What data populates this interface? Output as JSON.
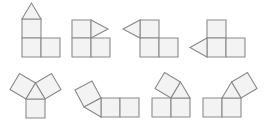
{
  "style": {
    "background": "#ffffff",
    "stroke": "#8a8a8a",
    "fill": "#f3f3f3",
    "stroke_width": 1.1
  },
  "figures": [
    {
      "id": "net-1",
      "squares": [
        [
          [
            22,
            19
          ],
          [
            41,
            19
          ],
          [
            41,
            38
          ],
          [
            22,
            38
          ]
        ],
        [
          [
            22,
            38
          ],
          [
            41,
            38
          ],
          [
            41,
            57
          ],
          [
            22,
            57
          ]
        ],
        [
          [
            41,
            38
          ],
          [
            60,
            38
          ],
          [
            60,
            57
          ],
          [
            41,
            57
          ]
        ]
      ],
      "triangles": [
        [
          [
            22,
            19
          ],
          [
            41,
            19
          ],
          [
            31.5,
            3
          ]
        ]
      ]
    },
    {
      "id": "net-2",
      "squares": [
        [
          [
            72,
            20
          ],
          [
            91,
            20
          ],
          [
            91,
            38
          ],
          [
            72,
            38
          ]
        ],
        [
          [
            72,
            38
          ],
          [
            91,
            38
          ],
          [
            91,
            57
          ],
          [
            72,
            57
          ]
        ],
        [
          [
            91,
            38
          ],
          [
            110,
            38
          ],
          [
            110,
            57
          ],
          [
            91,
            57
          ]
        ]
      ],
      "triangles": [
        [
          [
            91,
            20
          ],
          [
            108,
            29
          ],
          [
            91,
            38
          ]
        ]
      ]
    },
    {
      "id": "net-3",
      "squares": [
        [
          [
            140,
            20
          ],
          [
            159,
            20
          ],
          [
            159,
            38
          ],
          [
            140,
            38
          ]
        ],
        [
          [
            140,
            38
          ],
          [
            159,
            38
          ],
          [
            159,
            57
          ],
          [
            140,
            57
          ]
        ],
        [
          [
            159,
            38
          ],
          [
            178,
            38
          ],
          [
            178,
            57
          ],
          [
            159,
            57
          ]
        ]
      ],
      "triangles": [
        [
          [
            140,
            20
          ],
          [
            140,
            38
          ],
          [
            123,
            29
          ]
        ]
      ]
    },
    {
      "id": "net-4",
      "squares": [
        [
          [
            207,
            20
          ],
          [
            226,
            20
          ],
          [
            226,
            38
          ],
          [
            207,
            38
          ]
        ],
        [
          [
            207,
            38
          ],
          [
            226,
            38
          ],
          [
            226,
            57
          ],
          [
            207,
            57
          ]
        ],
        [
          [
            226,
            38
          ],
          [
            245,
            38
          ],
          [
            245,
            57
          ],
          [
            226,
            57
          ]
        ]
      ],
      "triangles": [
        [
          [
            207,
            38
          ],
          [
            207,
            57
          ],
          [
            190,
            47.5
          ]
        ]
      ]
    },
    {
      "id": "net-5",
      "squares": [
        [
          [
            26,
            99
          ],
          [
            45,
            99
          ],
          [
            45,
            118
          ],
          [
            26,
            118
          ]
        ],
        [
          [
            26,
            99
          ],
          [
            35.5,
            83
          ],
          [
            19.5,
            73.5
          ],
          [
            10,
            89.5
          ]
        ],
        [
          [
            35.5,
            83
          ],
          [
            45,
            99
          ],
          [
            61,
            89.5
          ],
          [
            51.5,
            73.5
          ]
        ]
      ],
      "triangles": [
        [
          [
            26,
            99
          ],
          [
            45,
            99
          ],
          [
            35.5,
            83
          ]
        ]
      ]
    },
    {
      "id": "net-6",
      "squares": [
        [
          [
            101,
            98
          ],
          [
            120,
            98
          ],
          [
            120,
            117
          ],
          [
            101,
            117
          ]
        ],
        [
          [
            120,
            98
          ],
          [
            139,
            98
          ],
          [
            139,
            117
          ],
          [
            120,
            117
          ]
        ],
        [
          [
            84,
            107
          ],
          [
            101,
            98
          ],
          [
            92,
            81
          ],
          [
            75,
            90
          ]
        ]
      ],
      "triangles": [
        [
          [
            101,
            98
          ],
          [
            101,
            117
          ],
          [
            84,
            107
          ]
        ]
      ]
    },
    {
      "id": "net-7",
      "squares": [
        [
          [
            152,
            98
          ],
          [
            171,
            98
          ],
          [
            171,
            117
          ],
          [
            152,
            117
          ]
        ],
        [
          [
            171,
            98
          ],
          [
            190,
            98
          ],
          [
            190,
            117
          ],
          [
            171,
            117
          ]
        ],
        [
          [
            171,
            98
          ],
          [
            180.5,
            82
          ],
          [
            164.5,
            72.5
          ],
          [
            155,
            88.5
          ]
        ]
      ],
      "triangles": [
        [
          [
            171,
            98
          ],
          [
            190,
            98
          ],
          [
            180.5,
            82
          ]
        ]
      ]
    },
    {
      "id": "net-8",
      "squares": [
        [
          [
            203,
            98
          ],
          [
            222,
            98
          ],
          [
            222,
            117
          ],
          [
            203,
            117
          ]
        ],
        [
          [
            222,
            98
          ],
          [
            241,
            98
          ],
          [
            241,
            117
          ],
          [
            222,
            117
          ]
        ],
        [
          [
            231.5,
            82
          ],
          [
            241,
            98
          ],
          [
            257,
            88.5
          ],
          [
            247.5,
            72.5
          ]
        ]
      ],
      "triangles": [
        [
          [
            222,
            98
          ],
          [
            241,
            98
          ],
          [
            231.5,
            82
          ]
        ]
      ]
    }
  ]
}
